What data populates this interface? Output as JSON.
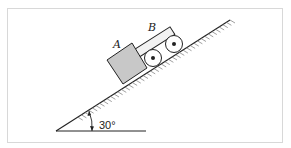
{
  "diagram": {
    "type": "physics-incline",
    "incline_angle_label": "30°",
    "block_a_label": "A",
    "cart_b_label": "B",
    "colors": {
      "block_fill": "#c8c8c8",
      "cart_fill": "#f2f2f2",
      "line": "#222222",
      "frame": "#d8d8d8"
    }
  }
}
